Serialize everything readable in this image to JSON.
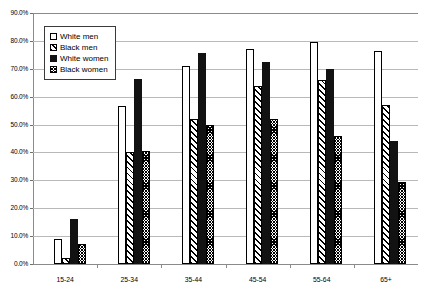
{
  "chart_data": {
    "type": "bar",
    "title": "",
    "xlabel": "",
    "ylabel": "",
    "ylim": [
      0,
      90
    ],
    "grid": true,
    "legend_position": "top-left",
    "categories": [
      "15-24",
      "25-34",
      "35-44",
      "45-54",
      "55-64",
      "65+"
    ],
    "ytick_labels": [
      "0.0%",
      "10.0%",
      "20.0%",
      "30.0%",
      "40.0%",
      "50.0%",
      "60.0%",
      "70.0%",
      "80.0%",
      "90.0%"
    ],
    "ytick_values": [
      0,
      10,
      20,
      30,
      40,
      50,
      60,
      70,
      80,
      90
    ],
    "series": [
      {
        "name": "White men",
        "pattern": "white",
        "values": [
          9.0,
          56.5,
          71.0,
          77.0,
          79.5,
          76.5
        ]
      },
      {
        "name": "Black men",
        "pattern": "diag",
        "values": [
          2.0,
          40.0,
          52.0,
          64.0,
          66.0,
          57.0
        ]
      },
      {
        "name": "White women",
        "pattern": "solid",
        "values": [
          16.0,
          66.5,
          75.5,
          72.5,
          70.0,
          44.0
        ]
      },
      {
        "name": "Black women",
        "pattern": "check",
        "values": [
          7.0,
          40.5,
          50.0,
          52.0,
          46.0,
          29.5
        ]
      }
    ]
  }
}
